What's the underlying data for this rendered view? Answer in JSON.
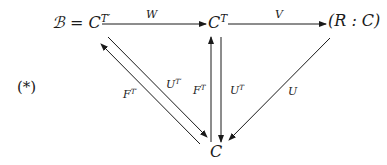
{
  "equation_tag": "(*)",
  "nodes": {
    "b_eq_ctprime": {
      "base": "ℬ = C",
      "sup": "T′"
    },
    "ct": {
      "base": "C",
      "sup": "T"
    },
    "rc": {
      "base": "(R : C)",
      "sup": ""
    },
    "c": {
      "base": "C",
      "sup": ""
    }
  },
  "edges": {
    "w": {
      "base": "W",
      "sup": ""
    },
    "v": {
      "base": "V",
      "sup": ""
    },
    "ftprime": {
      "base": "F",
      "sup": "T′"
    },
    "utprime": {
      "base": "U",
      "sup": "T′"
    },
    "ft": {
      "base": "F",
      "sup": "T"
    },
    "ut": {
      "base": "U",
      "sup": "T"
    },
    "u": {
      "base": "U",
      "sup": ""
    }
  },
  "colors": {
    "ink": "#1a1a1a",
    "background": "#ffffff"
  }
}
